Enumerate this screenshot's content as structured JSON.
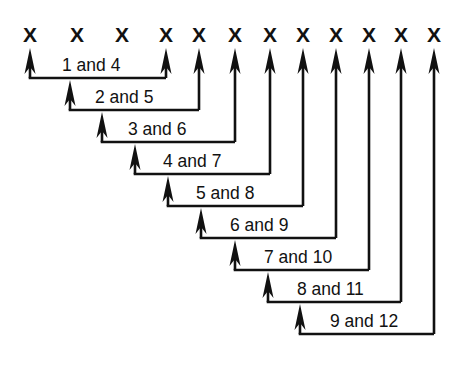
{
  "figure": {
    "background_color": "#ffffff",
    "ink_color": "#111111",
    "width": 466,
    "height": 380
  },
  "marks": {
    "glyph": "X",
    "count": 12,
    "label": "x-mark-row",
    "positions_x": [
      30,
      77,
      122,
      166,
      199,
      235,
      270,
      303,
      336,
      369,
      401,
      434
    ],
    "baseline_y": 42
  },
  "brackets": [
    {
      "label": "1 and 4",
      "from_index": 1,
      "to_index": 4,
      "left_x": 30,
      "right_x": 166,
      "line_y": 78,
      "text_x": 62,
      "text_y": 71
    },
    {
      "label": "2 and 5",
      "from_index": 2,
      "to_index": 5,
      "left_x": 70,
      "right_x": 199,
      "line_y": 110,
      "text_x": 95,
      "text_y": 103
    },
    {
      "label": "3 and 6",
      "from_index": 3,
      "to_index": 6,
      "left_x": 102,
      "right_x": 235,
      "line_y": 142,
      "text_x": 128,
      "text_y": 135
    },
    {
      "label": "4 and 7",
      "from_index": 4,
      "to_index": 7,
      "left_x": 135,
      "right_x": 270,
      "line_y": 174,
      "text_x": 163,
      "text_y": 167
    },
    {
      "label": "5 and 8",
      "from_index": 5,
      "to_index": 8,
      "left_x": 168,
      "right_x": 303,
      "line_y": 206,
      "text_x": 196,
      "text_y": 199
    },
    {
      "label": "6 and 9",
      "from_index": 6,
      "to_index": 9,
      "left_x": 201,
      "right_x": 336,
      "line_y": 238,
      "text_x": 230,
      "text_y": 231
    },
    {
      "label": "7 and 10",
      "from_index": 7,
      "to_index": 10,
      "left_x": 235,
      "right_x": 369,
      "line_y": 270,
      "text_x": 264,
      "text_y": 263
    },
    {
      "label": "8 and 11",
      "from_index": 8,
      "to_index": 11,
      "left_x": 268,
      "right_x": 401,
      "line_y": 302,
      "text_x": 297,
      "text_y": 295
    },
    {
      "label": "9 and 12",
      "from_index": 9,
      "to_index": 12,
      "left_x": 300,
      "right_x": 434,
      "line_y": 334,
      "text_x": 330,
      "text_y": 327
    }
  ],
  "arrow": {
    "tip_y": 48,
    "head_height": 26,
    "head_half_width": 5.5,
    "name": "up-arrow"
  }
}
